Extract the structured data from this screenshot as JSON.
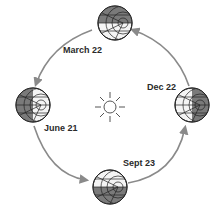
{
  "diagram": {
    "title": "",
    "center": {
      "name": "Sun",
      "icon": "sun-icon"
    },
    "positions": [
      {
        "id": "march",
        "label": "March 22",
        "shaded": "top"
      },
      {
        "id": "june",
        "label": "June 21",
        "shaded": "left"
      },
      {
        "id": "sept",
        "label": "Sept 23",
        "shaded": "bottom"
      },
      {
        "id": "dec",
        "label": "Dec 22",
        "shaded": "right"
      }
    ],
    "orbit_direction": "counterclockwise",
    "colors": {
      "arrow": "#8a8a8a",
      "globe_shade": "#7a7a7a",
      "lines": "#333333"
    }
  }
}
